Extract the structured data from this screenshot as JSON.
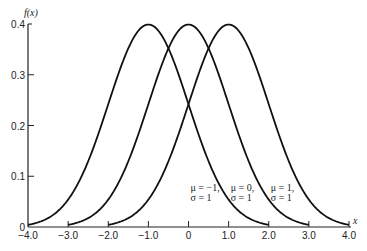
{
  "chart_data": {
    "type": "line",
    "title": "",
    "xlabel": "x",
    "ylabel": "f(x)",
    "xlim": [
      -4.0,
      4.0
    ],
    "ylim": [
      0,
      0.4
    ],
    "grid": false,
    "x_ticks": [
      -4.0,
      -3.0,
      -2.0,
      -1.0,
      0,
      1.0,
      2.0,
      3.0,
      4.0
    ],
    "x_tick_labels": [
      "−4.0",
      "−3.0",
      "−2.0",
      "−1.0",
      "0",
      "1.0",
      "2.0",
      "3.0",
      "4.0"
    ],
    "y_ticks": [
      0,
      0.1,
      0.2,
      0.3,
      0.4
    ],
    "y_tick_labels": [
      "0",
      "0.1",
      "0.2",
      "0.3",
      "0.4"
    ],
    "function": "normal_pdf",
    "series": [
      {
        "name": "mu=-1, sigma=1",
        "mu": -1,
        "sigma": 1,
        "label_line1": "μ = −1,",
        "label_line2": "σ = 1",
        "label_x": 0.05,
        "label_y": 0.07
      },
      {
        "name": "mu=0, sigma=1",
        "mu": 0,
        "sigma": 1,
        "label_line1": "μ = 0,",
        "label_line2": "σ = 1",
        "label_x": 1.05,
        "label_y": 0.07
      },
      {
        "name": "mu=1, sigma=1",
        "mu": 1,
        "sigma": 1,
        "label_line1": "μ = 1,",
        "label_line2": "σ = 1",
        "label_x": 2.05,
        "label_y": 0.07
      }
    ]
  }
}
